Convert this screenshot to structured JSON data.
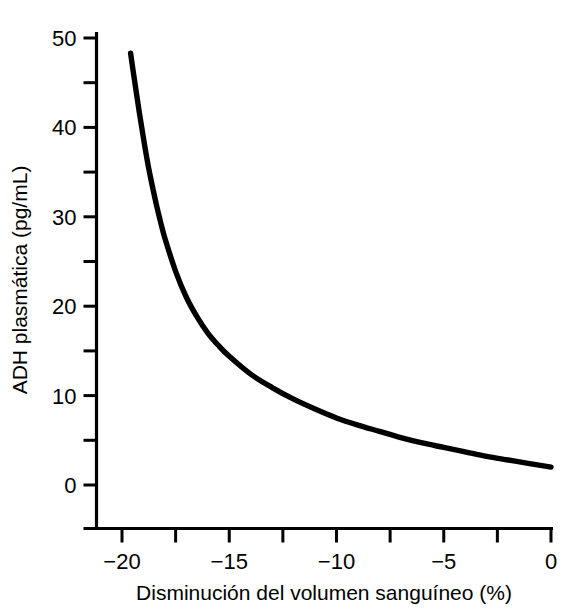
{
  "chart_data": {
    "type": "line",
    "title": "",
    "xlabel": "Disminución del volumen sanguíneo (%)",
    "ylabel": "ADH plasmática (pg/mL)",
    "xlim": [
      -20,
      0
    ],
    "ylim": [
      0,
      50
    ],
    "grid": false,
    "legend": "none",
    "x_major_ticks": [
      -20,
      -15,
      -10,
      -5,
      0
    ],
    "x_major_tick_labels": [
      "−20",
      "−15",
      "−10",
      "−5",
      "0"
    ],
    "x_minor_ticks": [
      -17.5,
      -12.5,
      -7.5,
      -2.5
    ],
    "y_major_ticks": [
      0,
      10,
      20,
      30,
      40,
      50
    ],
    "y_major_tick_labels": [
      "0",
      "10",
      "20",
      "30",
      "40",
      "50"
    ],
    "y_minor_ticks": [
      5,
      15,
      25,
      35,
      45
    ],
    "series": [
      {
        "name": "ADH plasmática",
        "color": "#000000",
        "x": [
          -19.6,
          -19.4,
          -19.2,
          -19.0,
          -18.8,
          -18.6,
          -18.4,
          -18.2,
          -18.0,
          -17.5,
          -17.0,
          -16.5,
          -16.0,
          -15.5,
          -15.0,
          -14.0,
          -13.0,
          -12.0,
          -11.0,
          -10.0,
          -9.0,
          -8.0,
          -7.0,
          -6.0,
          -5.0,
          -4.0,
          -3.0,
          -2.0,
          -1.0,
          0.0
        ],
        "y": [
          48.3,
          45.0,
          41.8,
          38.8,
          36.0,
          33.6,
          31.4,
          29.4,
          27.6,
          23.9,
          21.0,
          18.8,
          17.0,
          15.6,
          14.4,
          12.4,
          10.9,
          9.6,
          8.5,
          7.5,
          6.7,
          6.0,
          5.3,
          4.7,
          4.2,
          3.7,
          3.2,
          2.8,
          2.4,
          2.0
        ]
      }
    ]
  },
  "axes": {
    "x_title": "Disminución del volumen sanguíneo (%)",
    "y_title": "ADH plasmática (pg/mL)"
  }
}
